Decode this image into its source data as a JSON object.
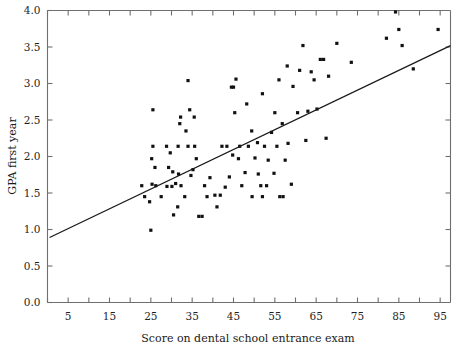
{
  "chart_data": {
    "type": "scatter",
    "title": "",
    "xlabel": "Score on dental school entrance exam",
    "ylabel": "GPA first year",
    "xlim": [
      0,
      97.5
    ],
    "ylim": [
      0.0,
      4.0
    ],
    "xticks": [
      5,
      15,
      25,
      35,
      45,
      55,
      65,
      75,
      85,
      95
    ],
    "xticks_minor": [
      0,
      10,
      20,
      30,
      40,
      50,
      60,
      70,
      80,
      90
    ],
    "yticks": [
      0.0,
      0.5,
      1.0,
      1.5,
      2.0,
      2.5,
      3.0,
      3.5,
      4.0
    ],
    "xtick_labels": [
      "5",
      "15",
      "25",
      "35",
      "45",
      "55",
      "65",
      "75",
      "85",
      "95"
    ],
    "ytick_labels": [
      "0.0",
      "0.5",
      "1.0",
      "1.5",
      "2.0",
      "2.5",
      "3.0",
      "3.5",
      "4.0"
    ],
    "grid": false,
    "legend": false,
    "point_color": "#111111",
    "line_color": "#1a1a1a",
    "axis_color": "#6f6f6f",
    "trendline": {
      "x": [
        0.5,
        97.5
      ],
      "y": [
        0.89,
        3.52
      ],
      "slope": 0.0271,
      "intercept": 0.876
    },
    "points": [
      [
        25.5,
        2.64
      ],
      [
        25.5,
        2.14
      ],
      [
        25.2,
        1.97
      ],
      [
        26.0,
        1.85
      ],
      [
        25.3,
        1.62
      ],
      [
        26.2,
        1.6
      ],
      [
        24.7,
        1.38
      ],
      [
        25.0,
        0.99
      ],
      [
        28.8,
        2.14
      ],
      [
        29.3,
        1.85
      ],
      [
        29.7,
        2.05
      ],
      [
        30.3,
        1.79
      ],
      [
        28.9,
        1.59
      ],
      [
        30.1,
        1.59
      ],
      [
        31.0,
        1.63
      ],
      [
        32.2,
        2.54
      ],
      [
        32.0,
        2.45
      ],
      [
        31.6,
        2.14
      ],
      [
        31.7,
        1.76
      ],
      [
        32.3,
        1.6
      ],
      [
        33.5,
        2.35
      ],
      [
        34.0,
        3.04
      ],
      [
        34.4,
        2.64
      ],
      [
        34.0,
        2.14
      ],
      [
        34.7,
        1.74
      ],
      [
        35.2,
        1.82
      ],
      [
        35.6,
        2.14
      ],
      [
        35.5,
        2.54
      ],
      [
        36.6,
        1.18
      ],
      [
        37.4,
        1.18
      ],
      [
        31.5,
        1.31
      ],
      [
        33.2,
        1.45
      ],
      [
        38.6,
        1.45
      ],
      [
        40.5,
        1.47
      ],
      [
        41.8,
        1.47
      ],
      [
        39.3,
        1.71
      ],
      [
        43.0,
        1.58
      ],
      [
        44.0,
        1.72
      ],
      [
        44.8,
        2.02
      ],
      [
        44.5,
        2.95
      ],
      [
        45.0,
        2.95
      ],
      [
        45.6,
        3.06
      ],
      [
        45.3,
        2.6
      ],
      [
        46.5,
        2.14
      ],
      [
        46.2,
        1.97
      ],
      [
        47.0,
        1.6
      ],
      [
        47.8,
        1.78
      ],
      [
        48.6,
        2.14
      ],
      [
        48.2,
        2.72
      ],
      [
        49.4,
        2.35
      ],
      [
        50.2,
        1.98
      ],
      [
        50.8,
        2.19
      ],
      [
        51.0,
        1.76
      ],
      [
        51.6,
        1.6
      ],
      [
        52.5,
        2.14
      ],
      [
        52.0,
        2.86
      ],
      [
        53.4,
        1.95
      ],
      [
        53.0,
        1.6
      ],
      [
        54.2,
        2.33
      ],
      [
        54.8,
        1.77
      ],
      [
        55.5,
        2.14
      ],
      [
        55.0,
        2.6
      ],
      [
        56.0,
        3.05
      ],
      [
        56.8,
        2.45
      ],
      [
        57.5,
        1.95
      ],
      [
        58.2,
        2.18
      ],
      [
        59.0,
        1.62
      ],
      [
        52.0,
        1.45
      ],
      [
        49.5,
        1.45
      ],
      [
        60.5,
        2.6
      ],
      [
        61.0,
        3.18
      ],
      [
        61.8,
        3.52
      ],
      [
        62.5,
        2.22
      ],
      [
        63.0,
        2.62
      ],
      [
        63.8,
        3.16
      ],
      [
        64.5,
        3.05
      ],
      [
        65.2,
        2.65
      ],
      [
        66.0,
        3.33
      ],
      [
        66.8,
        3.33
      ],
      [
        67.4,
        2.25
      ],
      [
        58.0,
        3.24
      ],
      [
        59.4,
        2.96
      ],
      [
        68.0,
        3.1
      ],
      [
        70.0,
        3.55
      ],
      [
        73.5,
        3.29
      ],
      [
        82.0,
        3.62
      ],
      [
        84.2,
        3.98
      ],
      [
        85.0,
        3.74
      ],
      [
        85.8,
        3.52
      ],
      [
        88.5,
        3.2
      ],
      [
        94.5,
        3.74
      ],
      [
        30.5,
        1.2
      ],
      [
        22.8,
        1.6
      ],
      [
        23.5,
        1.45
      ],
      [
        27.5,
        1.45
      ],
      [
        38.0,
        1.6
      ],
      [
        42.2,
        2.14
      ],
      [
        43.4,
        2.14
      ],
      [
        36.0,
        1.97
      ],
      [
        41.0,
        1.31
      ],
      [
        56.2,
        1.45
      ],
      [
        57.0,
        1.45
      ]
    ]
  }
}
